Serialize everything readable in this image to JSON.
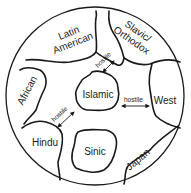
{
  "diagram": {
    "type": "civilizations-map",
    "regions": [
      {
        "id": "latin",
        "label_line1": "Latin",
        "label_line2": "American"
      },
      {
        "id": "slavic",
        "label_line1": "Slavic/",
        "label_line2": "Orthodox"
      },
      {
        "id": "african",
        "label": "African"
      },
      {
        "id": "islamic",
        "label": "Islamic"
      },
      {
        "id": "west",
        "label": "West"
      },
      {
        "id": "hindu",
        "label": "Hindu"
      },
      {
        "id": "sinic",
        "label": "Sinic"
      },
      {
        "id": "japan",
        "label": "Japan"
      }
    ],
    "relations": [
      {
        "from": "Islamic",
        "to": "Slavic/Orthodox",
        "label": "hostile"
      },
      {
        "from": "Islamic",
        "to": "West",
        "label": "hostile"
      },
      {
        "from": "Islamic",
        "to": "Hindu",
        "label": "hostile"
      }
    ],
    "colors": {
      "ink": "#1a1a1a",
      "background": "#ffffff"
    }
  }
}
